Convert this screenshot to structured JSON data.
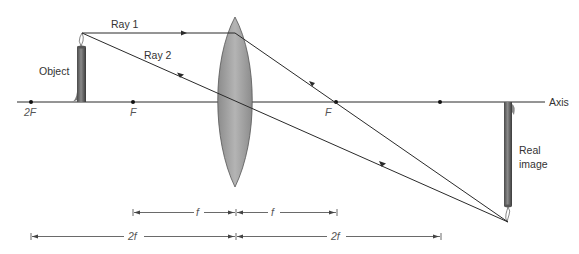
{
  "diagram": {
    "labels": {
      "ray1": "Ray 1",
      "ray2": "Ray 2",
      "object": "Object",
      "axis": "Axis",
      "image_line1": "Real",
      "image_line2": "image",
      "left_2f_point": "2F",
      "left_f_point": "F",
      "right_f_point": "F",
      "dim_f_left": "f",
      "dim_f_right": "f",
      "dim_2f_left": "2f",
      "dim_2f_right": "2f"
    },
    "colors": {
      "line": "#2a2a2a",
      "lens_fill": "#9a9a9a",
      "lens_stroke": "#555555",
      "object_fill": "#6e6e6e",
      "text": "#333333",
      "dim_line": "#444444"
    },
    "geometry": {
      "axis_y": 102,
      "lens_center_x": 235,
      "focal_length_px": 101,
      "points_x": {
        "left_2F": 31,
        "left_F": 133,
        "right_F": 336,
        "right_2F": 440
      },
      "object": {
        "x": 81,
        "top_y": 33
      },
      "image": {
        "x": 508,
        "tip_y": 222
      }
    }
  }
}
